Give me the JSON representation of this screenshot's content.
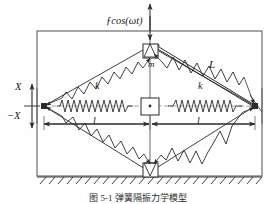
{
  "figure": {
    "title_caption": "图 5-1  弹簧隔振力学模型",
    "labels": {
      "force": "ƒcos(ωt)",
      "mass": "m",
      "diagonal_length": "L",
      "spring_stiffness_left_diagonal": "k",
      "spring_stiffness_right_diagonal": "k",
      "half_length_left": "l",
      "half_length_right": "l",
      "displacement_positive": "X",
      "displacement_negative": "−X"
    },
    "colors": {
      "line": "#2b2b2b",
      "frame": "#555555",
      "axis_dashed": "#7a7a7a",
      "background": "#fefefe"
    },
    "geometry": {
      "frame": {
        "x": 37,
        "y": 31,
        "width": 225,
        "height": 145
      },
      "center_node": {
        "x": 150,
        "y": 106
      },
      "top_node": {
        "x": 150,
        "y": 46
      },
      "bottom_node": {
        "x": 150,
        "y": 172
      },
      "left_node": {
        "x": 44,
        "y": 106
      },
      "right_node": {
        "x": 255,
        "y": 106
      }
    },
    "elements": {
      "ground_hatch": "hatched-ground",
      "mass_box_top": "mass-block",
      "mass_box_center": "center-block",
      "mass_box_bottom": "base-block",
      "springs_diagonal_count": 4,
      "springs_horizontal_count": 2
    }
  }
}
